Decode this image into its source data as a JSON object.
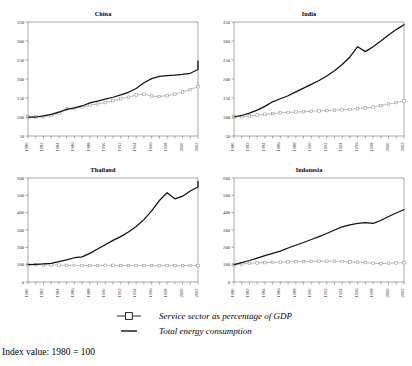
{
  "caption": "Index value: 1980 = 100",
  "legend": {
    "items": [
      {
        "label": "Service sector as percentage of GDP",
        "key": "line-with-open-square-marker",
        "color": "#8c8c8c"
      },
      {
        "label": "Total energy consumption",
        "key": "solid-line",
        "color": "#111111"
      }
    ]
  },
  "chart_data": [
    {
      "type": "line",
      "title": "China",
      "xlabel": "",
      "ylabel": "",
      "xlim": [
        1980,
        2002
      ],
      "ylim": [
        50,
        350
      ],
      "yticks": [
        50,
        100,
        150,
        200,
        250,
        300,
        350
      ],
      "xticks": [
        1980,
        1982,
        1984,
        1986,
        1988,
        1990,
        1992,
        1994,
        1996,
        1998,
        2000,
        2002
      ],
      "x": [
        1980,
        1981,
        1982,
        1983,
        1984,
        1985,
        1986,
        1987,
        1988,
        1989,
        1990,
        1991,
        1992,
        1993,
        1994,
        1995,
        1996,
        1997,
        1998,
        1999,
        2000,
        2001,
        2002
      ],
      "series": [
        {
          "name": "Service sector as percentage of GDP",
          "values": [
            100,
            100,
            101,
            104,
            110,
            121,
            122,
            126,
            131,
            134,
            138,
            143,
            148,
            152,
            158,
            160,
            155,
            154,
            156,
            160,
            166,
            172,
            180,
            193
          ]
        },
        {
          "name": "Total energy consumption",
          "values": [
            100,
            100,
            103,
            107,
            113,
            120,
            124,
            129,
            137,
            142,
            147,
            152,
            158,
            165,
            175,
            190,
            201,
            207,
            209,
            210,
            212,
            215,
            225,
            248
          ]
        }
      ],
      "grid": false
    },
    {
      "type": "line",
      "title": "India",
      "xlabel": "",
      "ylabel": "",
      "xlim": [
        1980,
        2002
      ],
      "ylim": [
        50,
        350
      ],
      "yticks": [
        50,
        100,
        150,
        200,
        250,
        300,
        350
      ],
      "xticks": [
        1980,
        1982,
        1984,
        1986,
        1988,
        1990,
        1992,
        1994,
        1996,
        1998,
        2000,
        2002
      ],
      "x": [
        1980,
        1981,
        1982,
        1983,
        1984,
        1985,
        1986,
        1987,
        1988,
        1989,
        1990,
        1991,
        1992,
        1993,
        1994,
        1995,
        1996,
        1997,
        1998,
        1999,
        2000,
        2001,
        2002
      ],
      "series": [
        {
          "name": "Service sector as percentage of GDP",
          "values": [
            100,
            101,
            103,
            105,
            107,
            109,
            111,
            112,
            113,
            114,
            115,
            116,
            117,
            118,
            119,
            120,
            122,
            124,
            126,
            130,
            134,
            138,
            142
          ]
        },
        {
          "name": "Total energy consumption",
          "values": [
            100,
            104,
            110,
            118,
            128,
            140,
            148,
            156,
            166,
            176,
            186,
            196,
            208,
            222,
            238,
            258,
            285,
            272,
            285,
            300,
            316,
            330,
            343
          ]
        }
      ],
      "grid": false
    },
    {
      "type": "line",
      "title": "Thailand",
      "xlabel": "",
      "ylabel": "",
      "xlim": [
        1980,
        2002
      ],
      "ylim": [
        0,
        600
      ],
      "yticks": [
        0,
        100,
        200,
        300,
        400,
        500,
        600
      ],
      "xticks": [
        1980,
        1982,
        1984,
        1986,
        1988,
        1990,
        1992,
        1994,
        1996,
        1998,
        2000,
        2002
      ],
      "x": [
        1980,
        1981,
        1982,
        1983,
        1984,
        1985,
        1986,
        1987,
        1988,
        1989,
        1990,
        1991,
        1992,
        1993,
        1994,
        1995,
        1996,
        1997,
        1998,
        1999,
        2000,
        2001,
        2002
      ],
      "series": [
        {
          "name": "Service sector as percentage of GDP",
          "values": [
            100,
            100,
            99,
            98,
            97,
            96,
            96,
            95,
            95,
            95,
            96,
            96,
            95,
            95,
            95,
            95,
            95,
            94,
            95,
            95,
            95,
            95,
            95
          ]
        },
        {
          "name": "Total energy consumption",
          "values": [
            100,
            102,
            104,
            108,
            118,
            128,
            140,
            145,
            165,
            190,
            215,
            240,
            262,
            288,
            320,
            360,
            410,
            470,
            515,
            480,
            495,
            525,
            548,
            580
          ]
        }
      ],
      "grid": false
    },
    {
      "type": "line",
      "title": "Indonesia",
      "xlabel": "",
      "ylabel": "",
      "xlim": [
        1980,
        2002
      ],
      "ylim": [
        0,
        600
      ],
      "yticks": [
        0,
        100,
        200,
        300,
        400,
        500,
        600
      ],
      "xticks": [
        1980,
        1982,
        1984,
        1986,
        1988,
        1990,
        1992,
        1994,
        1996,
        1998,
        2000,
        2002
      ],
      "x": [
        1980,
        1981,
        1982,
        1983,
        1984,
        1985,
        1986,
        1987,
        1988,
        1989,
        1990,
        1991,
        1992,
        1993,
        1994,
        1995,
        1996,
        1997,
        1998,
        1999,
        2000,
        2001,
        2002
      ],
      "series": [
        {
          "name": "Service sector as percentage of GDP",
          "values": [
            100,
            104,
            108,
            110,
            112,
            113,
            115,
            116,
            118,
            118,
            119,
            119,
            120,
            120,
            118,
            116,
            114,
            112,
            108,
            106,
            108,
            110,
            112
          ]
        },
        {
          "name": "Total energy consumption",
          "values": [
            100,
            112,
            124,
            138,
            152,
            165,
            178,
            196,
            212,
            228,
            245,
            262,
            280,
            300,
            318,
            330,
            338,
            342,
            338,
            355,
            378,
            398,
            418
          ]
        }
      ],
      "grid": false
    }
  ]
}
